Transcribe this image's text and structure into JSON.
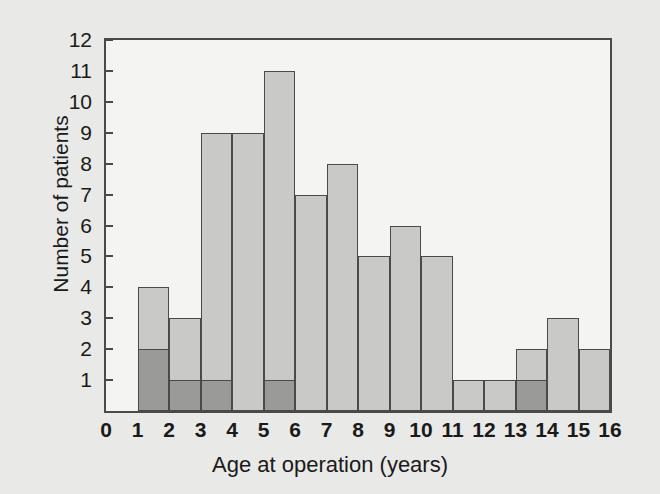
{
  "chart_data": {
    "type": "bar",
    "title": "",
    "subtitle": "",
    "xlabel": "Age at operation (years)",
    "ylabel": "Number of patients",
    "xlim": [
      0,
      16
    ],
    "ylim": [
      0,
      12
    ],
    "x_tick_labels": [
      "0",
      "1",
      "2",
      "3",
      "4",
      "5",
      "6",
      "7",
      "8",
      "9",
      "10",
      "11",
      "12",
      "13",
      "14",
      "15",
      "16"
    ],
    "y_tick_labels": [
      "1",
      "2",
      "3",
      "4",
      "5",
      "6",
      "7",
      "8",
      "9",
      "10",
      "11",
      "12"
    ],
    "grid": false,
    "legend": null,
    "bin_width": 1,
    "categories": [
      "0-1",
      "1-2",
      "2-3",
      "3-4",
      "4-5",
      "5-6",
      "6-7",
      "7-8",
      "8-9",
      "9-10",
      "10-11",
      "11-12",
      "12-13",
      "13-14",
      "14-15",
      "15-16"
    ],
    "series": [
      {
        "name": "Total patients",
        "color": "#c9c9c7",
        "values": [
          0,
          4,
          3,
          9,
          9,
          11,
          7,
          8,
          5,
          6,
          5,
          1,
          1,
          2,
          3,
          2
        ]
      },
      {
        "name": "Shaded subgroup",
        "color": "#9a9a98",
        "values": [
          0,
          2,
          1,
          1,
          0,
          1,
          0,
          0,
          0,
          0,
          0,
          0,
          0,
          1,
          0,
          0
        ]
      }
    ],
    "bars": [
      {
        "bin_start": 0,
        "bin_end": 1,
        "total": 0,
        "dark": 0
      },
      {
        "bin_start": 1,
        "bin_end": 2,
        "total": 4,
        "dark": 2
      },
      {
        "bin_start": 2,
        "bin_end": 3,
        "total": 3,
        "dark": 1
      },
      {
        "bin_start": 3,
        "bin_end": 4,
        "total": 9,
        "dark": 1
      },
      {
        "bin_start": 4,
        "bin_end": 5,
        "total": 9,
        "dark": 0
      },
      {
        "bin_start": 5,
        "bin_end": 6,
        "total": 11,
        "dark": 1
      },
      {
        "bin_start": 6,
        "bin_end": 7,
        "total": 7,
        "dark": 0
      },
      {
        "bin_start": 7,
        "bin_end": 8,
        "total": 8,
        "dark": 0
      },
      {
        "bin_start": 8,
        "bin_end": 9,
        "total": 5,
        "dark": 0
      },
      {
        "bin_start": 9,
        "bin_end": 10,
        "total": 6,
        "dark": 0
      },
      {
        "bin_start": 10,
        "bin_end": 11,
        "total": 5,
        "dark": 0
      },
      {
        "bin_start": 11,
        "bin_end": 12,
        "total": 1,
        "dark": 0
      },
      {
        "bin_start": 12,
        "bin_end": 13,
        "total": 1,
        "dark": 0
      },
      {
        "bin_start": 13,
        "bin_end": 14,
        "total": 2,
        "dark": 1
      },
      {
        "bin_start": 14,
        "bin_end": 15,
        "total": 3,
        "dark": 0
      },
      {
        "bin_start": 15,
        "bin_end": 16,
        "total": 2,
        "dark": 0
      }
    ],
    "colors": {
      "background": "#e9e9e7",
      "plot_background": "#f4f4f2",
      "axis": "#4a4a4a",
      "bar_light": "#c9c9c7",
      "bar_dark": "#9a9a98",
      "text": "#1a1a1a"
    }
  }
}
